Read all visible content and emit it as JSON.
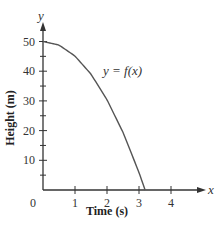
{
  "chart_data": {
    "type": "line",
    "title": "",
    "xlabel": "Time (s)",
    "ylabel": "Height (m)",
    "x_axis_var": "x",
    "y_axis_var": "y",
    "xlim": [
      0,
      4.4
    ],
    "ylim": [
      0,
      55
    ],
    "x_ticks": [
      0,
      1,
      2,
      3,
      4
    ],
    "x_tick_labels": [
      "0",
      "1",
      "2",
      "3",
      "4"
    ],
    "y_ticks": [
      10,
      20,
      30,
      40,
      50
    ],
    "y_tick_labels": [
      "10",
      "20",
      "30",
      "40",
      "50"
    ],
    "y_minor_ticks": [
      5,
      15,
      25,
      35,
      45
    ],
    "grid": false,
    "legend": null,
    "annotations": [
      {
        "text": "y = f(x)",
        "x": 2.1,
        "y": 40
      }
    ],
    "series": [
      {
        "name": "y = f(x)",
        "x": [
          0,
          0.5,
          1,
          1.5,
          2,
          2.5,
          3,
          3.19
        ],
        "values": [
          50,
          48.8,
          45.1,
          39.0,
          30.4,
          19.4,
          5.9,
          0
        ]
      }
    ],
    "color": "#555555"
  }
}
